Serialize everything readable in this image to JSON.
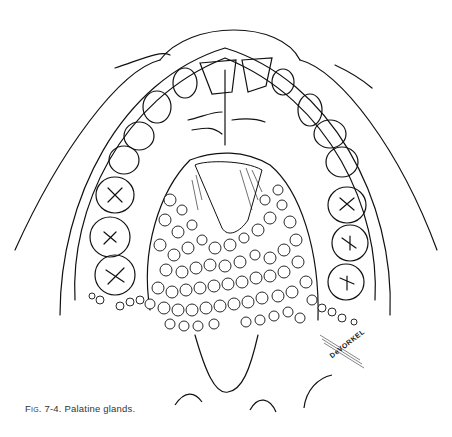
{
  "figure": {
    "label": "Fig. 7-4.",
    "caption": "Palatine glands.",
    "artist_signature": "DeVORKEL"
  }
}
